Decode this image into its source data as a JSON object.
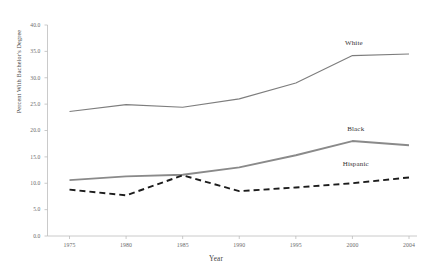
{
  "chart_data": {
    "type": "line",
    "title": "",
    "xlabel": "Year",
    "ylabel": "Percent With Bachelor's Degree",
    "x": [
      1975,
      1980,
      1985,
      1990,
      1995,
      2000,
      2004
    ],
    "xtick_labels": [
      "1975",
      "1980",
      "1985",
      "1990",
      "1995",
      "2000",
      "2004"
    ],
    "ytick_labels": [
      "0.0",
      "5.0",
      "10.0",
      "15.0",
      "20.0",
      "25.0",
      "30.0",
      "35.0",
      "40.0"
    ],
    "ytick_values": [
      0,
      5,
      10,
      15,
      20,
      25,
      30,
      35,
      40
    ],
    "ylim": [
      0,
      40
    ],
    "xlim": [
      1975,
      2004
    ],
    "grid": false,
    "legend_position": "inline-right-of-series",
    "series": [
      {
        "name": "White",
        "values": [
          23.6,
          24.9,
          24.4,
          26.0,
          29.0,
          34.2,
          34.5
        ],
        "color": "#7d7d7d",
        "style": "solid",
        "width": 1.1,
        "label_x": 2000.4,
        "label_y": 36.6
      },
      {
        "name": "Black",
        "values": [
          10.6,
          11.3,
          11.6,
          13.0,
          15.3,
          18.0,
          17.2
        ],
        "color": "#8a8a8a",
        "style": "solid",
        "width": 1.9,
        "label_x": 2000.6,
        "label_y": 20.3
      },
      {
        "name": "Hispanic",
        "values": [
          8.8,
          7.7,
          11.5,
          8.5,
          9.2,
          10.0,
          11.1
        ],
        "color": "#1c1c1c",
        "style": "dashed",
        "width": 1.9,
        "label_x": 2000.2,
        "label_y": 13.6
      }
    ]
  },
  "axis": {
    "line_color": "#bcbcbc",
    "tick_color": "#bcbcbc"
  }
}
